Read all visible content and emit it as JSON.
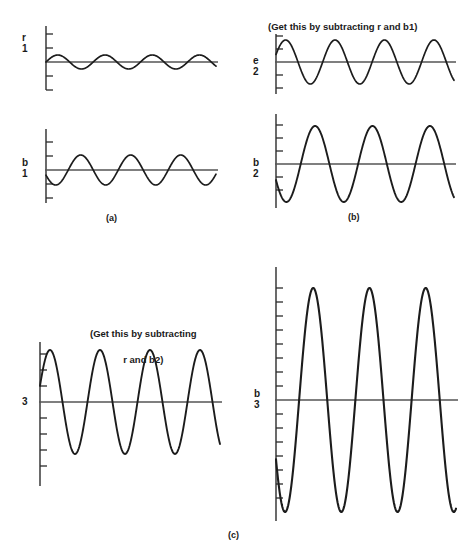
{
  "figure": {
    "background_color": "#ffffff",
    "ink_color": "#1c1c1c"
  },
  "group_labels": [
    {
      "id": "group-a",
      "text": "(a)"
    },
    {
      "id": "group-b",
      "text": "(b)"
    },
    {
      "id": "group-c",
      "text": "(c)"
    }
  ],
  "captions": [
    {
      "id": "caption-b",
      "text": "(Get this by subtracting r and b1)"
    },
    {
      "id": "caption-c",
      "line1": "(Get this by subtracting",
      "line2": "r and b2)"
    }
  ],
  "panels": [
    {
      "id": "panel-r1",
      "symbol": "r",
      "subscript": "1",
      "cycles": 3.6,
      "amplitude": 7,
      "phase_deg": 0,
      "ticks": 5,
      "tick_spacing": 14,
      "baseline_slope": 0
    },
    {
      "id": "panel-b1",
      "symbol": "b",
      "subscript": "1",
      "cycles": 3.4,
      "amplitude": 15,
      "phase_deg": 200,
      "ticks": 5,
      "tick_spacing": 14,
      "baseline_slope": 0
    },
    {
      "id": "panel-e2",
      "symbol": "e",
      "subscript": "2",
      "cycles": 3.6,
      "amplitude": 22,
      "phase_deg": 20,
      "ticks": 5,
      "tick_spacing": 13,
      "baseline_slope": 0
    },
    {
      "id": "panel-b2",
      "symbol": "b",
      "subscript": "2",
      "cycles": 3.1,
      "amplitude": 38,
      "phase_deg": 205,
      "ticks": 6,
      "tick_spacing": 13,
      "baseline_slope": 0
    },
    {
      "id": "panel-r3",
      "symbol": "",
      "subscript": "3",
      "cycles": 3.6,
      "amplitude": 52,
      "phase_deg": 18,
      "ticks": 9,
      "tick_spacing": 16,
      "baseline_slope": 0
    },
    {
      "id": "panel-b3",
      "symbol": "b",
      "subscript": "3",
      "cycles": 3.2,
      "amplitude": 112,
      "phase_deg": 212,
      "ticks": 16,
      "tick_spacing": 14,
      "baseline_slope": 0
    }
  ],
  "chart_data": {
    "type": "line",
    "xlabel": "",
    "ylabel": "",
    "grid": false,
    "legend": "none",
    "panel_layout": [
      [
        "panel-r1",
        "panel-e2"
      ],
      [
        "panel-b1",
        "panel-b2"
      ],
      [
        "panel-r3",
        "panel-b3"
      ]
    ],
    "series": [
      {
        "name": "r1",
        "panel": "panel-r1",
        "group": "(a)",
        "waveform": "sine",
        "cycles": 3.6,
        "relative_amplitude": 0.06,
        "phase_deg": 0,
        "description": "Low-amplitude sine about the r1 baseline"
      },
      {
        "name": "b1",
        "panel": "panel-b1",
        "group": "(a)",
        "waveform": "sine",
        "cycles": 3.4,
        "relative_amplitude": 0.13,
        "phase_deg": 200,
        "description": "Moderate-amplitude sine about the b1 baseline, starting downward"
      },
      {
        "name": "e2",
        "panel": "panel-e2",
        "group": "(b)",
        "waveform": "sine",
        "cycles": 3.6,
        "relative_amplitude": 0.2,
        "phase_deg": 20,
        "description": "Result of subtracting r and b1"
      },
      {
        "name": "b2",
        "panel": "panel-b2",
        "group": "(b)",
        "waveform": "sine",
        "cycles": 3.1,
        "relative_amplitude": 0.34,
        "phase_deg": 205,
        "description": "Larger-amplitude sine about the b2 baseline"
      },
      {
        "name": "r3",
        "panel": "panel-r3",
        "group": "(c)",
        "waveform": "sine",
        "cycles": 3.6,
        "relative_amplitude": 0.47,
        "phase_deg": 18,
        "description": "Result of subtracting r and b2"
      },
      {
        "name": "b3",
        "panel": "panel-b3",
        "group": "(c)",
        "waveform": "sine",
        "cycles": 3.2,
        "relative_amplitude": 1.0,
        "phase_deg": 212,
        "description": "Full-scale sine about the b3 baseline"
      }
    ]
  }
}
